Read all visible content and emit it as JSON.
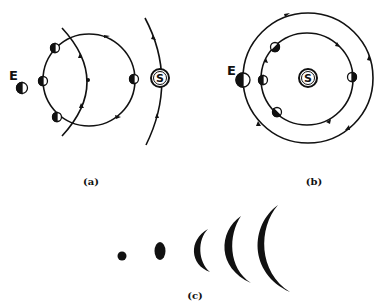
{
  "diagram": {
    "panels": [
      {
        "id": "a",
        "caption": "(a)",
        "earth_label": "E",
        "sun_label": "S",
        "description": "Moon orbit around Earth shown with Earth's orbit arc and Sun's orbit arc"
      },
      {
        "id": "b",
        "caption": "(b)",
        "earth_label": "E",
        "sun_label": "S",
        "description": "Inner planet orbit and outer orbit concentric around Sun"
      },
      {
        "id": "c",
        "caption": "(c)",
        "description": "Sequence of phases: dot, gibbous, then growing crescents"
      }
    ],
    "colors": {
      "ink": "#111111",
      "background": "#ffffff"
    }
  }
}
